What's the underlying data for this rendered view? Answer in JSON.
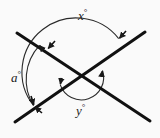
{
  "figure": {
    "type": "geometry-diagram",
    "background_color": "#fafafa",
    "stroke_color": "#1a1a1a",
    "labels": {
      "x": {
        "text": "x",
        "degree": "°",
        "full": "x°"
      },
      "a": {
        "text": "a",
        "degree": "°",
        "full": "a°"
      },
      "y": {
        "text": "y",
        "degree": "°",
        "full": "y°"
      }
    },
    "geometry": {
      "intersection": {
        "x": 81,
        "y": 77
      },
      "lines": [
        {
          "name": "line-upleft-downright",
          "x1": 17,
          "y1": 33,
          "x2": 150,
          "y2": 121
        },
        {
          "name": "line-upright-downleft",
          "x1": 145,
          "y1": 32,
          "x2": 15,
          "y2": 122
        }
      ],
      "arcs": [
        {
          "name": "outer-arc-x",
          "radius": 50,
          "label": "x°"
        },
        {
          "name": "left-arc-a",
          "radius": 50,
          "label": "a°"
        },
        {
          "name": "inner-arc-y",
          "radius": 22,
          "label": "y°"
        }
      ]
    }
  }
}
